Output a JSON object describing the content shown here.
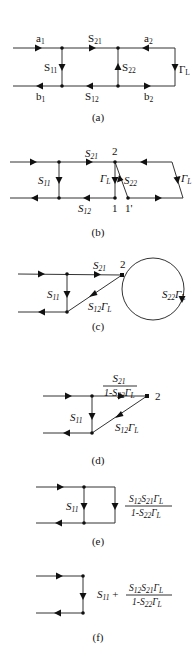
{
  "figure": {
    "panels": [
      {
        "id": "a",
        "caption": "(a)",
        "labels": {
          "a1": "a",
          "a1_sub": "1",
          "b1": "b",
          "b1_sub": "1",
          "s21": "S",
          "s21_sub": "21",
          "s11": "S",
          "s11_sub": "11",
          "s22": "S",
          "s22_sub": "22",
          "s12": "S",
          "s12_sub": "12",
          "a2": "a",
          "a2_sub": "2",
          "b2": "b",
          "b2_sub": "2",
          "gl": "Γ",
          "gl_sub": "L"
        }
      },
      {
        "id": "b",
        "caption": "(b)",
        "labels": {
          "s21": "S",
          "s21_sub": "21",
          "node2": "2",
          "s11": "S",
          "s11_sub": "11",
          "gl_inner": "Γ",
          "gl_inner_sub": "L",
          "s22": "S",
          "s22_sub": "22",
          "s12": "S",
          "s12_sub": "12",
          "node1": "1",
          "node1p": "1'",
          "gl_right": "Γ",
          "gl_right_sub": "L"
        }
      },
      {
        "id": "c",
        "caption": "(c)",
        "labels": {
          "s21": "S",
          "s21_sub": "21",
          "node2": "2",
          "s11": "S",
          "s11_sub": "11",
          "s12gl": "S",
          "s12gl_sub": "12",
          "s12gl_g": "Γ",
          "s12gl_gsub": "L",
          "loop": "S",
          "loop_sub": "22",
          "loop_g": "Γ",
          "loop_gsub": "L"
        }
      },
      {
        "id": "d",
        "caption": "(d)",
        "labels": {
          "num": "S",
          "num_sub": "21",
          "den_pre": "1-S",
          "den_sub": "22",
          "den_g": "Γ",
          "den_gsub": "L",
          "node2": "2",
          "s11": "S",
          "s11_sub": "11",
          "s12gl": "S",
          "s12gl_sub": "12",
          "s12gl_g": "Γ",
          "s12gl_gsub": "L"
        }
      },
      {
        "id": "e",
        "caption": "(e)",
        "labels": {
          "s11": "S",
          "s11_sub": "11",
          "num_a": "S",
          "num_a_sub": "12",
          "num_b": "S",
          "num_b_sub": "21",
          "num_g": "Γ",
          "num_gsub": "L",
          "den_pre": "1-S",
          "den_sub": "22",
          "den_g": "Γ",
          "den_gsub": "L"
        }
      },
      {
        "id": "f",
        "caption": "(f)",
        "labels": {
          "s11": "S",
          "s11_sub": "11",
          "plus": " +",
          "num_a": "S",
          "num_a_sub": "12",
          "num_b": "S",
          "num_b_sub": "21",
          "num_g": "Γ",
          "num_gsub": "L",
          "den_pre": "1-S",
          "den_sub": "22",
          "den_g": "Γ",
          "den_gsub": "L"
        }
      }
    ]
  }
}
